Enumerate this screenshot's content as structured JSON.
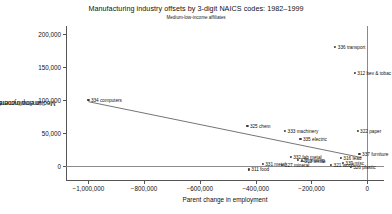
{
  "chart_data": {
    "type": "scatter",
    "title": "Manufacturing industry offsets by 3-digit NAICS codes: 1982–1999",
    "subtitle": "Medium-low-income affiliates",
    "xlabel": "Parent change in employment",
    "ylabel": "Medium/low income affiliate change in employment",
    "ylabel_line1": "Medium/low income affiliate change",
    "ylabel_line2": "in employment",
    "xlim": [
      -1080000,
      60000
    ],
    "ylim": [
      -22000,
      212000
    ],
    "xticks": [
      -1000000,
      -800000,
      -600000,
      -400000,
      -200000,
      0
    ],
    "xticklabels": [
      "−1,000,000",
      "−800,000",
      "−600,000",
      "−400,000",
      "−200,000",
      "0"
    ],
    "yticks": [
      0,
      50000,
      100000,
      150000,
      200000
    ],
    "yticklabels": [
      "0",
      "50,000",
      "100,000",
      "150,000",
      "200,000"
    ],
    "grid": false,
    "legend": "none",
    "reference_lines": [
      {
        "orientation": "horizontal",
        "value": 0
      },
      {
        "orientation": "vertical",
        "value": 0
      }
    ],
    "fit_line": {
      "label": "linear fit",
      "x_start": -1000000,
      "y_start": 97000,
      "x_end": -20000,
      "y_end": 12000
    },
    "points": [
      {
        "label": "334 computers",
        "x": -1000000,
        "y": 100000,
        "label_pos": "right"
      },
      {
        "label": "336 transport",
        "x": -115000,
        "y": 180000,
        "label_pos": "right"
      },
      {
        "label": "312 bev & tobac",
        "x": -45000,
        "y": 141000,
        "label_pos": "right"
      },
      {
        "label": "325 chem",
        "x": -430000,
        "y": 60000,
        "label_pos": "right"
      },
      {
        "label": "333 machinery",
        "x": -295000,
        "y": 52000,
        "label_pos": "right"
      },
      {
        "label": "322 paper",
        "x": -35000,
        "y": 52000,
        "label_pos": "right"
      },
      {
        "label": "335 electric",
        "x": -240000,
        "y": 40000,
        "label_pos": "right"
      },
      {
        "label": "337 furniture",
        "x": -28000,
        "y": 18000,
        "label_pos": "right"
      },
      {
        "label": "332 fab metal",
        "x": -275000,
        "y": 13000,
        "label_pos": "right"
      },
      {
        "label": "316 lead",
        "x": -95000,
        "y": 11000,
        "label_pos": "right"
      },
      {
        "label": "323 printing",
        "x": -250000,
        "y": 8000,
        "label_pos": "right"
      },
      {
        "label": "313 textile",
        "x": -235000,
        "y": 7000,
        "label_pos": "right"
      },
      {
        "label": "339 misc",
        "x": -88000,
        "y": 4000,
        "label_pos": "right"
      },
      {
        "label": "331 metal",
        "x": -375000,
        "y": 2000,
        "label_pos": "right"
      },
      {
        "label": "327 mineral",
        "x": -305000,
        "y": 1500,
        "label_pos": "right"
      },
      {
        "label": "321 wood",
        "x": -130000,
        "y": 1000,
        "label_pos": "right"
      },
      {
        "label": "326 plastic",
        "x": -60000,
        "y": -2000,
        "label_pos": "right"
      },
      {
        "label": "311 food",
        "x": -425000,
        "y": -6000,
        "label_pos": "right"
      }
    ]
  }
}
